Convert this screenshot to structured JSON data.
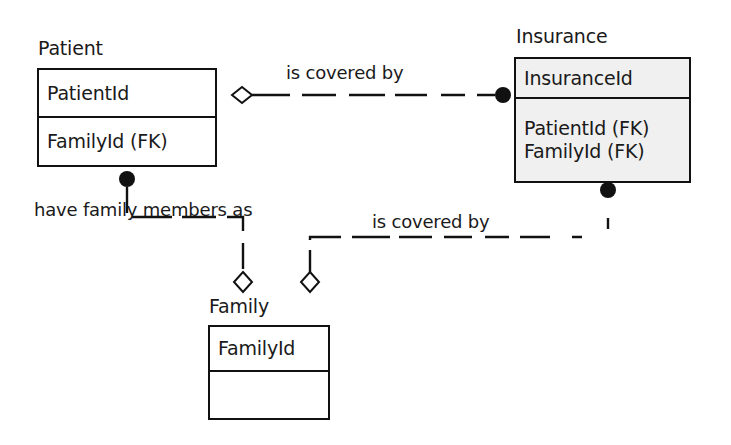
{
  "diagram": {
    "type": "entity-relationship-diagram",
    "notation": "crows-foot-uml-hybrid",
    "background_color": "#ffffff",
    "line_color": "#111111",
    "shaded_fill_color": "#f0f0f0",
    "entities": [
      {
        "id": "patient",
        "name": "Patient",
        "shaded": false,
        "primary_attributes": [
          "PatientId"
        ],
        "other_attributes": [
          "FamilyId (FK)"
        ],
        "box": {
          "x": 37,
          "y": 68,
          "width": 180,
          "height": 99
        },
        "name_label": {
          "x": 38,
          "y": 38
        },
        "divider_y": 118
      },
      {
        "id": "insurance",
        "name": "Insurance",
        "shaded": true,
        "primary_attributes": [
          "InsuranceId"
        ],
        "other_attributes": [
          "PatientId (FK)",
          "FamilyId (FK)"
        ],
        "box": {
          "x": 514,
          "y": 57,
          "width": 177,
          "height": 126
        },
        "name_label": {
          "x": 516,
          "y": 26
        },
        "divider_y": 99
      },
      {
        "id": "family",
        "name": "Family",
        "shaded": false,
        "primary_attributes": [
          "FamilyId"
        ],
        "other_attributes": [
          ""
        ],
        "box": {
          "x": 208,
          "y": 325,
          "width": 122,
          "height": 95
        },
        "name_label": {
          "x": 209,
          "y": 296
        },
        "divider_y": 372
      }
    ],
    "relationships": [
      {
        "id": "patient-insurance",
        "label": "is covered by",
        "label_position": {
          "x": 286,
          "y": 63
        },
        "from_entity": "patient",
        "from_marker": "hollow-diamond",
        "to_entity": "insurance",
        "to_marker": "filled-circle",
        "line_style": "dashed"
      },
      {
        "id": "patient-family",
        "label": "have family members as",
        "label_position": {
          "x": 34,
          "y": 200
        },
        "from_entity": "patient",
        "from_marker": "filled-circle",
        "to_entity": "family",
        "to_marker": "hollow-diamond",
        "line_style": "dashed"
      },
      {
        "id": "family-insurance",
        "label": "is covered by",
        "label_position": {
          "x": 372,
          "y": 212
        },
        "from_entity": "family",
        "from_marker": "hollow-diamond",
        "to_entity": "insurance",
        "to_marker": "filled-circle",
        "line_style": "dashed"
      }
    ]
  }
}
